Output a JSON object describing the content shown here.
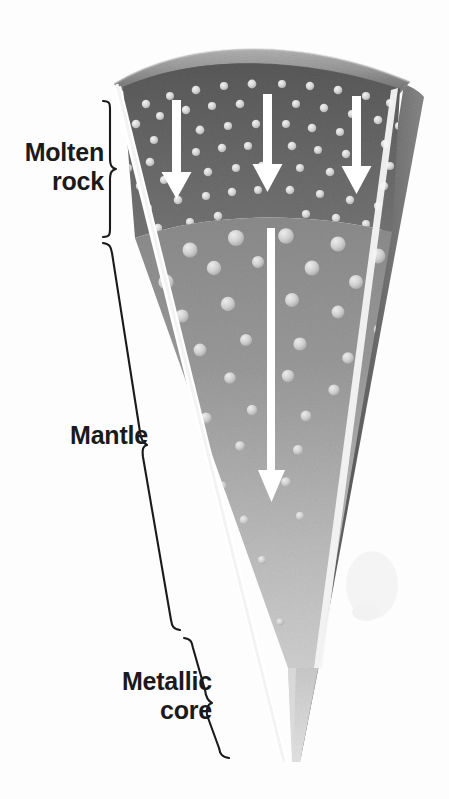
{
  "figure": {
    "background_color": "#fdfdfd"
  },
  "labels": {
    "molten_rock": "Molten\nrock",
    "mantle": "Mantle",
    "metallic_core": "Metallic\ncore"
  },
  "layers": [
    {
      "id": "crust",
      "name": "crust-band",
      "label": "",
      "color_top": "#a9a9a9",
      "color_bottom": "#7e7e7e",
      "has_bubbles": false
    },
    {
      "id": "molten-rock",
      "name": "molten-rock-layer",
      "label": "Molten rock",
      "color_top": "#5f5f5f",
      "color_bottom": "#767676",
      "bubble_color": "#d8d8d8",
      "bubble_size": "small",
      "arrow_count": 3
    },
    {
      "id": "mantle",
      "name": "mantle-layer",
      "label": "Mantle",
      "color_top": "#8e8e8e",
      "color_bottom": "#cfcfcf",
      "bubble_color": "#d6d6d6",
      "bubble_size": "large",
      "arrow_count": 1
    },
    {
      "id": "metallic-core",
      "name": "metallic-core-layer",
      "label": "Metallic core",
      "color_top": "#c8c8c8",
      "color_bottom": "#e2e2e2",
      "has_bubbles": false
    }
  ],
  "arrows": {
    "color": "#ffffff",
    "direction": "down",
    "short_arrows": [
      {
        "x": 177,
        "y_start": 100,
        "y_end": 195
      },
      {
        "x": 268,
        "y_start": 94,
        "y_end": 190
      },
      {
        "x": 357,
        "y_start": 96,
        "y_end": 192
      }
    ],
    "long_arrow": {
      "x": 271,
      "y_start": 228,
      "y_end": 500
    }
  },
  "braces": {
    "color": "#1a1a1a",
    "items": [
      {
        "name": "brace-molten-rock",
        "top": 100,
        "bottom": 238
      },
      {
        "name": "brace-mantle",
        "top": 243,
        "bottom": 632
      },
      {
        "name": "brace-metallic-core",
        "top": 637,
        "bottom": 757
      }
    ]
  },
  "colors": {
    "ink": "#1a1a1a",
    "highlight": "#ffffff",
    "side_face": "#6a6a6a",
    "page": "#fdfdfd"
  }
}
